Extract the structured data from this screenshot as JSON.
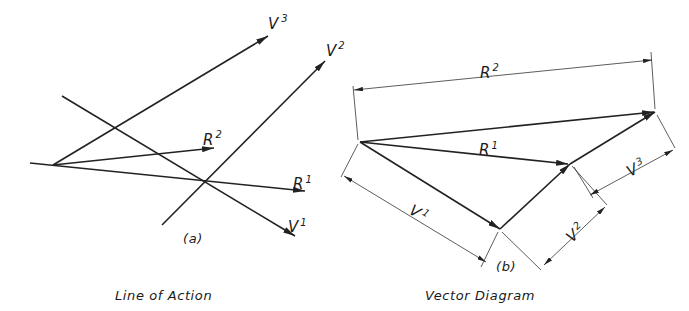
{
  "figure": {
    "panel_a": {
      "tag": "(a)",
      "caption": "Line of Action",
      "labels": {
        "v3": {
          "base": "V",
          "sup": "3"
        },
        "v2": {
          "base": "V",
          "sup": "2"
        },
        "v1": {
          "base": "V",
          "sup": "1"
        },
        "r2": {
          "base": "R",
          "sup": "2"
        },
        "r1": {
          "base": "R",
          "sup": "1"
        }
      }
    },
    "panel_b": {
      "tag": "(b)",
      "caption": "Vector Diagram",
      "labels": {
        "r2": {
          "base": "R",
          "sup": "2"
        },
        "r1": {
          "base": "R",
          "sup": "1"
        },
        "v1": {
          "base": "V",
          "sup": "1"
        },
        "v2": {
          "base": "V",
          "sup": "2"
        },
        "v3": {
          "base": "V",
          "sup": "3"
        }
      }
    },
    "colors": {
      "ink": "#222222",
      "background": "#ffffff"
    }
  }
}
